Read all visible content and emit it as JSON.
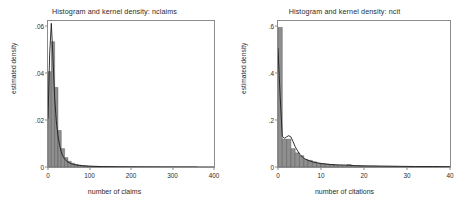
{
  "figure": {
    "panels": [
      {
        "id": "nclaims",
        "title": "Histogram and kernel density: nclaims",
        "xlabel": "number of claims",
        "ylabel": "estimated density",
        "xticks": [
          "0",
          "100",
          "200",
          "300",
          "400"
        ],
        "yticks": [
          "0",
          ".02",
          ".04",
          ".06"
        ]
      },
      {
        "id": "ncit",
        "title": "Histogram and kernel density: ncit",
        "xlabel": "number of citations",
        "ylabel": "estimated density",
        "xticks": [
          "0",
          "10",
          "20",
          "30",
          "40"
        ],
        "yticks": [
          "0",
          ".2",
          ".4",
          ".6"
        ]
      }
    ]
  },
  "chart_data": [
    {
      "type": "bar",
      "id": "nclaims",
      "title": "Histogram and kernel density: nclaims",
      "xlabel": "number of claims",
      "ylabel": "estimated density",
      "xlim": [
        0,
        400
      ],
      "ylim": [
        0,
        0.062
      ],
      "xticks": [
        0,
        100,
        200,
        300,
        400
      ],
      "yticks": [
        0,
        0.02,
        0.04,
        0.06
      ],
      "grid": false,
      "legend": false,
      "bin_width": 8,
      "bin_starts": [
        0,
        8,
        16,
        24,
        32,
        40,
        48,
        56,
        64,
        72,
        80,
        88,
        96,
        104,
        112,
        120,
        128,
        136,
        144,
        152,
        160,
        168,
        176,
        184,
        192,
        200,
        208,
        216,
        224,
        232,
        240,
        248,
        256,
        264,
        272,
        280,
        288,
        296,
        304,
        312,
        320,
        328,
        336,
        344,
        352
      ],
      "values": [
        0.0405,
        0.0532,
        0.0338,
        0.0155,
        0.0078,
        0.004,
        0.0024,
        0.0016,
        0.0011,
        0.0008,
        0.0006,
        0.00045,
        0.00035,
        0.00028,
        0.00022,
        0.00018,
        0.00014,
        0.00012,
        0.0001,
        9e-05,
        8e-05,
        7e-05,
        6e-05,
        5e-05,
        5e-05,
        4e-05,
        4e-05,
        3e-05,
        3e-05,
        3e-05,
        2e-05,
        2e-05,
        2e-05,
        2e-05,
        1e-05,
        1e-05,
        1e-05,
        1e-05,
        1e-05,
        1e-05,
        1e-05,
        1e-05,
        1e-05,
        1e-05,
        1e-05
      ],
      "kde": {
        "name": "kernel density",
        "x": [
          0,
          4,
          8,
          12,
          16,
          20,
          24,
          28,
          32,
          36,
          40,
          48,
          56,
          64,
          80,
          100,
          130,
          170,
          220,
          280,
          340,
          400
        ],
        "y": [
          0.0205,
          0.048,
          0.061,
          0.0465,
          0.0295,
          0.0196,
          0.0132,
          0.0092,
          0.0064,
          0.0046,
          0.0034,
          0.0021,
          0.0014,
          0.001,
          0.0006,
          0.00035,
          0.00018,
          0.0001,
          6e-05,
          3e-05,
          2e-05,
          1e-05
        ]
      }
    },
    {
      "type": "bar",
      "id": "ncit",
      "title": "Histogram and kernel density: ncit",
      "xlabel": "number of citations",
      "ylabel": "estimated density",
      "xlim": [
        0,
        40
      ],
      "ylim": [
        0,
        0.62
      ],
      "xticks": [
        0,
        10,
        20,
        30,
        40
      ],
      "yticks": [
        0,
        0.2,
        0.4,
        0.6
      ],
      "grid": false,
      "legend": false,
      "bin_width": 1,
      "bin_starts": [
        0,
        1,
        2,
        3,
        4,
        5,
        6,
        7,
        8,
        9,
        10,
        11,
        12,
        13,
        14,
        15,
        16,
        17,
        18,
        19,
        20,
        21,
        22,
        23,
        24,
        25,
        26,
        27,
        28,
        29,
        30,
        31,
        32,
        33,
        34,
        35,
        36,
        37,
        38,
        39
      ],
      "values": [
        0.593,
        0.118,
        0.118,
        0.078,
        0.06,
        0.048,
        0.032,
        0.028,
        0.022,
        0.016,
        0.014,
        0.012,
        0.01,
        0.008,
        0.007,
        0.006,
        0.01,
        0.005,
        0.004,
        0.004,
        0.003,
        0.003,
        0.003,
        0.002,
        0.002,
        0.002,
        0.002,
        0.002,
        0.001,
        0.001,
        0.001,
        0.001,
        0.001,
        0.001,
        0.001,
        0.001,
        0.001,
        0.001,
        0.001,
        0.001
      ],
      "kde": {
        "name": "kernel density",
        "x": [
          0,
          0.5,
          1,
          1.5,
          2,
          2.5,
          3,
          3.5,
          4,
          5,
          6,
          7,
          8,
          9,
          10,
          12,
          14,
          16,
          18,
          20,
          24,
          28,
          32,
          36,
          40
        ],
        "y": [
          0.505,
          0.3,
          0.13,
          0.122,
          0.128,
          0.133,
          0.128,
          0.108,
          0.086,
          0.055,
          0.037,
          0.028,
          0.022,
          0.018,
          0.015,
          0.011,
          0.009,
          0.008,
          0.006,
          0.005,
          0.004,
          0.003,
          0.002,
          0.002,
          0.001
        ]
      }
    }
  ]
}
